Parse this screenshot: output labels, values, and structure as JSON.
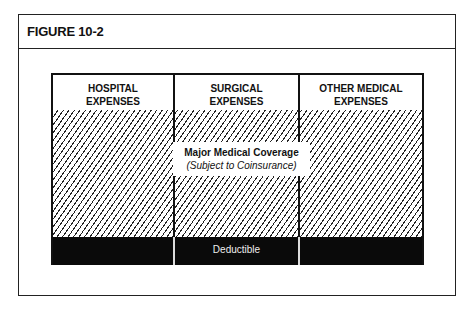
{
  "figure": {
    "title": "FIGURE 10-2"
  },
  "diagram": {
    "columns": [
      {
        "line1": "HOSPITAL",
        "line2": "EXPENSES"
      },
      {
        "line1": "SURGICAL",
        "line2": "EXPENSES"
      },
      {
        "line1": "OTHER MEDICAL",
        "line2": "EXPENSES"
      }
    ],
    "coverage_label": "Major Medical Coverage",
    "coverage_sublabel": "(Subject to Coinsurance)",
    "deductible_label": "Deductible",
    "colors": {
      "hatch": "#222222",
      "deductible_band": "#0a0a0a",
      "background": "#ffffff"
    }
  }
}
